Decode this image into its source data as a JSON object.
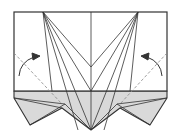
{
  "diagram": {
    "type": "origami-fold-step",
    "colors": {
      "stroke": "#333333",
      "paper_back": "#d9d9d9",
      "paper_front": "#ffffff",
      "valley": "#888888"
    },
    "annotations": [
      {
        "name": "left-fold-arrow",
        "direction": "up-right"
      },
      {
        "name": "right-fold-arrow",
        "direction": "up-left"
      }
    ]
  }
}
